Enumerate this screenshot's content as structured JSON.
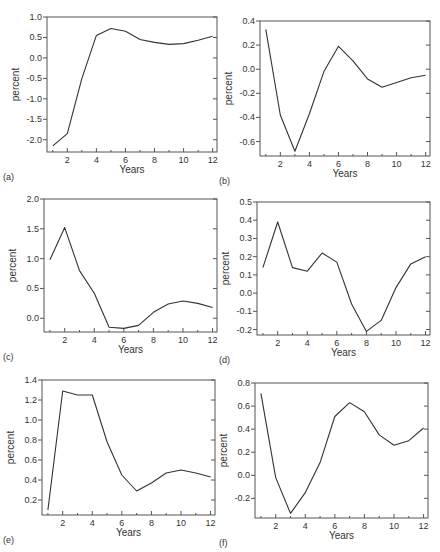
{
  "style": {
    "line_color": "#333333",
    "axis_color": "#555555",
    "text_color": "#333333"
  },
  "chart_data": [
    {
      "id": "a",
      "panel_label": "(a)",
      "type": "line",
      "xlabel": "Years",
      "ylabel": "percent",
      "xlim": [
        0.6,
        12.3
      ],
      "ylim": [
        -2.3,
        1.0
      ],
      "xticks": [
        2,
        4,
        6,
        8,
        10,
        12
      ],
      "yticks": [
        -2.0,
        -1.5,
        -1.0,
        -0.5,
        0.0,
        0.5,
        1.0
      ],
      "ytick_labels": [
        "-2.0",
        "-1.5",
        "-1.0",
        "-0.5",
        "0.0",
        "0.5",
        "1.0"
      ],
      "x": [
        1,
        2,
        3,
        4,
        5,
        6,
        7,
        8,
        9,
        10,
        11,
        12
      ],
      "values": [
        -2.15,
        -1.85,
        -0.5,
        0.55,
        0.72,
        0.65,
        0.45,
        0.38,
        0.33,
        0.35,
        0.43,
        0.53
      ],
      "box": {
        "left": 47,
        "top": 17,
        "right": 217,
        "bottom": 152
      }
    },
    {
      "id": "b",
      "panel_label": "(b)",
      "type": "line",
      "xlabel": "Years",
      "ylabel": "percent",
      "xlim": [
        0.6,
        12.3
      ],
      "ylim": [
        -0.72,
        0.4
      ],
      "xticks": [
        2,
        4,
        6,
        8,
        10,
        12
      ],
      "yticks": [
        -0.6,
        -0.4,
        -0.2,
        0.0,
        0.2,
        0.4
      ],
      "ytick_labels": [
        "-0.6",
        "-0.4",
        "-0.2",
        "0.0",
        "0.2",
        "0.4"
      ],
      "x": [
        1,
        2,
        3,
        4,
        5,
        6,
        7,
        8,
        9,
        10,
        11,
        12
      ],
      "values": [
        0.33,
        -0.38,
        -0.68,
        -0.37,
        -0.02,
        0.19,
        0.07,
        -0.08,
        -0.15,
        -0.11,
        -0.07,
        -0.05
      ],
      "box": {
        "left": 260,
        "top": 21,
        "right": 430,
        "bottom": 156
      }
    },
    {
      "id": "c",
      "panel_label": "(c)",
      "type": "line",
      "xlabel": "Years",
      "ylabel": "percent",
      "xlim": [
        0.6,
        12.3
      ],
      "ylim": [
        -0.23,
        2.0
      ],
      "xticks": [
        2,
        4,
        6,
        8,
        10,
        12
      ],
      "yticks": [
        0.0,
        0.5,
        1.0,
        1.5,
        2.0
      ],
      "ytick_labels": [
        "0.0",
        "0.5",
        "1.0",
        "1.5",
        "2.0"
      ],
      "x": [
        1,
        2,
        3,
        4,
        5,
        6,
        7,
        8,
        9,
        10,
        11,
        12
      ],
      "values": [
        0.98,
        1.52,
        0.8,
        0.42,
        -0.15,
        -0.17,
        -0.12,
        0.1,
        0.24,
        0.29,
        0.25,
        0.18
      ],
      "box": {
        "left": 44,
        "top": 199,
        "right": 217,
        "bottom": 332
      }
    },
    {
      "id": "d",
      "panel_label": "(d)",
      "type": "line",
      "xlabel": "Years",
      "ylabel": "percent",
      "xlim": [
        0.6,
        12.3
      ],
      "ylim": [
        -0.23,
        0.5
      ],
      "xticks": [
        2,
        4,
        6,
        8,
        10,
        12
      ],
      "yticks": [
        -0.2,
        -0.1,
        0.0,
        0.1,
        0.2,
        0.3,
        0.4,
        0.5
      ],
      "ytick_labels": [
        "-0.2",
        "-0.1",
        "0.0",
        "0.1",
        "0.2",
        "0.3",
        "0.4",
        "0.5"
      ],
      "x": [
        1,
        2,
        3,
        4,
        5,
        6,
        7,
        8,
        9,
        10,
        11,
        12
      ],
      "values": [
        0.14,
        0.39,
        0.14,
        0.12,
        0.22,
        0.17,
        -0.06,
        -0.21,
        -0.15,
        0.03,
        0.16,
        0.2
      ],
      "box": {
        "left": 257,
        "top": 202,
        "right": 430,
        "bottom": 335
      }
    },
    {
      "id": "e",
      "panel_label": "(e)",
      "type": "line",
      "xlabel": "Years",
      "ylabel": "percent",
      "xlim": [
        0.6,
        12.3
      ],
      "ylim": [
        0.05,
        1.4
      ],
      "xticks": [
        2,
        4,
        6,
        8,
        10,
        12
      ],
      "yticks": [
        0.2,
        0.4,
        0.6,
        0.8,
        1.0,
        1.2,
        1.4
      ],
      "ytick_labels": [
        "0.2",
        "0.4",
        "0.6",
        "0.8",
        "1.0",
        "1.2",
        "1.4"
      ],
      "x": [
        1,
        2,
        3,
        4,
        5,
        6,
        7,
        8,
        9,
        10,
        11,
        12
      ],
      "values": [
        0.1,
        1.29,
        1.25,
        1.25,
        0.78,
        0.45,
        0.29,
        0.37,
        0.47,
        0.5,
        0.47,
        0.43
      ],
      "box": {
        "left": 42,
        "top": 380,
        "right": 215,
        "bottom": 515
      }
    },
    {
      "id": "f",
      "panel_label": "(f)",
      "type": "line",
      "xlabel": "Years",
      "ylabel": "percent",
      "xlim": [
        0.6,
        12.3
      ],
      "ylim": [
        -0.37,
        0.8
      ],
      "xticks": [
        2,
        4,
        6,
        8,
        10,
        12
      ],
      "yticks": [
        -0.2,
        0.0,
        0.2,
        0.4,
        0.6,
        0.8
      ],
      "ytick_labels": [
        "-0.2",
        "0.0",
        "0.2",
        "0.4",
        "0.6",
        "0.8"
      ],
      "x": [
        1,
        2,
        3,
        4,
        5,
        6,
        7,
        8,
        9,
        10,
        11,
        12
      ],
      "values": [
        0.71,
        -0.02,
        -0.33,
        -0.15,
        0.11,
        0.51,
        0.63,
        0.55,
        0.35,
        0.26,
        0.3,
        0.41
      ],
      "box": {
        "left": 255,
        "top": 383,
        "right": 428,
        "bottom": 518
      }
    }
  ]
}
